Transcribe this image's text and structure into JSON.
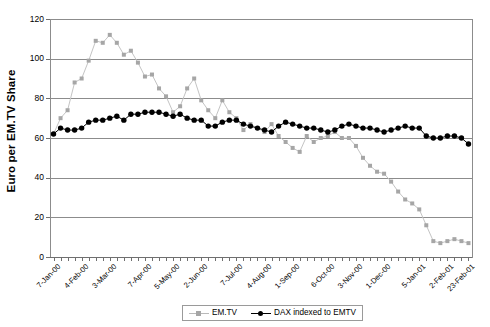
{
  "chart_data": {
    "type": "line",
    "title": "",
    "xlabel": "",
    "ylabel": "Euro per EM.TV Share",
    "ylim": [
      0,
      120
    ],
    "ytick_labels": [
      "0",
      "20",
      "40",
      "60",
      "80",
      "100",
      "120"
    ],
    "ytick_values": [
      0,
      20,
      40,
      60,
      80,
      100,
      120
    ],
    "grid": "horizontal",
    "legend_position": "bottom-center",
    "xtick_labels": [
      "7-Jan-00",
      "4-Feb-00",
      "3-Mar-00",
      "7-Apr-00",
      "5-May-00",
      "2-Jun-00",
      "7-Jul-00",
      "4-Aug-00",
      "1-Sep-00",
      "6-Oct-00",
      "3-Nov-00",
      "1-Dec-00",
      "5-Jan-01",
      "2-Feb-01",
      "23-Feb-01"
    ],
    "xtick_indices": [
      0,
      4,
      8,
      13,
      17,
      21,
      26,
      30,
      34,
      39,
      43,
      47,
      52,
      56,
      59
    ],
    "n_points": 60,
    "series": [
      {
        "name": "EM.TV",
        "color": "#a6a6a6",
        "line_color": "#c4c4c4",
        "marker": "square",
        "values": [
          62,
          70,
          74,
          88,
          90,
          99,
          109,
          108,
          112,
          108,
          102,
          104,
          98,
          91,
          92,
          85,
          81,
          73,
          76,
          85,
          90,
          79,
          74,
          70,
          79,
          73,
          70,
          64,
          67,
          65,
          63,
          67,
          61,
          58,
          55,
          53,
          61,
          58,
          60,
          61,
          63,
          60,
          60,
          56,
          50,
          46,
          43,
          42,
          38,
          33,
          29,
          27,
          24,
          16,
          8,
          7,
          8,
          9,
          8,
          7
        ]
      },
      {
        "name": "DAX indexed to EMTV",
        "color": "#000000",
        "line_color": "#000000",
        "marker": "circle",
        "values": [
          62,
          65,
          64,
          64,
          65,
          68,
          69,
          69,
          70,
          71,
          69,
          72,
          72,
          73,
          73,
          73,
          72,
          71,
          72,
          70,
          69,
          69,
          66,
          66,
          68,
          69,
          69,
          67,
          66,
          65,
          64,
          63,
          66,
          68,
          67,
          66,
          65,
          65,
          64,
          63,
          64,
          66,
          67,
          66,
          65,
          65,
          64,
          63,
          64,
          65,
          66,
          65,
          65,
          61,
          60,
          60,
          61,
          61,
          60,
          57
        ]
      }
    ]
  },
  "legend": {
    "items": [
      {
        "label": "EM.TV"
      },
      {
        "label": "DAX indexed to EMTV"
      }
    ]
  },
  "axis": {
    "y_title": "Euro per EM.TV Share"
  }
}
